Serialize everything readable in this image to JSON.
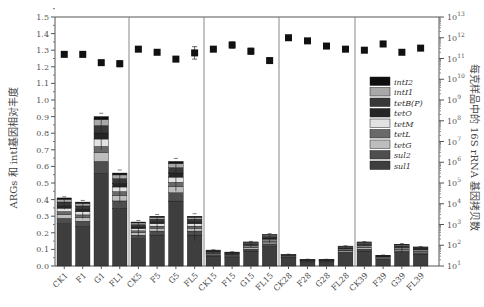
{
  "chart_data": {
    "type": "bar",
    "subtype": "stacked bar with secondary log-scale scatter",
    "categories": [
      "CK1",
      "F1",
      "G1",
      "FL1",
      "CK5",
      "F5",
      "G5",
      "FL5",
      "CK15",
      "F15",
      "G15",
      "FL15",
      "CK28",
      "F28",
      "G28",
      "FL28",
      "CK39",
      "F39",
      "G39",
      "FL39"
    ],
    "groups": [
      [
        "CK1",
        "F1",
        "G1",
        "FL1"
      ],
      [
        "CK5",
        "F5",
        "G5",
        "FL5"
      ],
      [
        "CK15",
        "F15",
        "G15",
        "FL15"
      ],
      [
        "CK28",
        "F28",
        "G28",
        "FL28"
      ],
      [
        "CK39",
        "F39",
        "G39",
        "FL39"
      ]
    ],
    "ylabel": "ARGs 和 intI基因相对丰度",
    "ylabel2": "每克样品中的 16S rRNA 基因拷贝数",
    "ylim": [
      0,
      1.5
    ],
    "yticks": [
      "0.0",
      "0.1",
      "0.2",
      "0.3",
      "0.4",
      "0.5",
      "0.6",
      "0.7",
      "0.8",
      "0.9",
      "1.0",
      "1.1",
      "1.2",
      "1.3",
      "1.4",
      "1.5"
    ],
    "y2_scale": "log",
    "y2lim_exponent": [
      1,
      13
    ],
    "y2ticks": [
      "10^1",
      "10^2",
      "10^3",
      "10^4",
      "10^5",
      "10^6",
      "10^7",
      "10^8",
      "10^9",
      "10^10",
      "10^11",
      "10^12",
      "10^13"
    ],
    "stack_totals": [
      0.41,
      0.385,
      0.9,
      0.56,
      0.265,
      0.3,
      0.63,
      0.3,
      0.096,
      0.084,
      0.145,
      0.19,
      0.07,
      0.04,
      0.04,
      0.12,
      0.145,
      0.065,
      0.13,
      0.115
    ],
    "stack_error": [
      0.07,
      0.1,
      0.2,
      0.18,
      0.09,
      0.1,
      0.18,
      0.15,
      0.02,
      0.02,
      0.03,
      0.05,
      0.01,
      0.01,
      0.01,
      0.02,
      0.02,
      0.01,
      0.05,
      0.02
    ],
    "legend": [
      "intI2",
      "intI1",
      "tetB(P)",
      "tetO",
      "tetM",
      "tetL",
      "tetG",
      "sul2",
      "sul1"
    ],
    "legend_colors": [
      "#0e0e0e",
      "#a8a8a8",
      "#383838",
      "#262626",
      "#e2e2e2",
      "#696969",
      "#bdbdbd",
      "#4e4e4e",
      "#3e3e3e"
    ],
    "approx_stack_fractions_bottom_to_top": {
      "sul1": 0.62,
      "sul2": 0.08,
      "tetG": 0.06,
      "tetL": 0.04,
      "tetM": 0.05,
      "tetO": 0.04,
      "tetB(P)": 0.05,
      "intI1": 0.04,
      "intI2": 0.02
    },
    "series2": {
      "name": "16S rRNA gene copies per g sample",
      "marker": "square",
      "log10_values": [
        11.2,
        11.2,
        10.8,
        10.75,
        11.45,
        11.3,
        10.97,
        11.27,
        11.45,
        11.65,
        11.35,
        10.9,
        12.0,
        11.85,
        11.6,
        11.45,
        11.4,
        11.7,
        11.3,
        11.5
      ],
      "log10_error": [
        0.1,
        0.25,
        0.15,
        0.3,
        0.1,
        0.15,
        0.05,
        0.6,
        0.05,
        0.3,
        0.3,
        0.25,
        0.1,
        0.05,
        0.05,
        0.05,
        0.05,
        0.25,
        0.05,
        0.2
      ]
    },
    "grid": false,
    "legend_position": "inside right"
  }
}
